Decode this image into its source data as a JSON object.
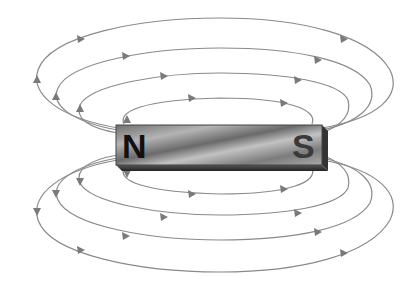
{
  "diagram": {
    "magnet": {
      "north_label": "N",
      "south_label": "S",
      "north_color": "#111111",
      "south_color": "#3a3a3a",
      "body_color": "#8f8f8f"
    },
    "field_lines": {
      "color": "#8a8a8a",
      "upper_count": 4,
      "lower_count": 4,
      "direction": "N to S outside the magnet"
    }
  }
}
